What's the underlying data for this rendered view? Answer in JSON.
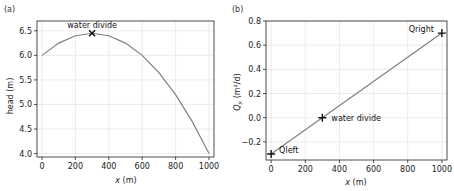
{
  "chart_data": [
    {
      "panel_label": "(a)",
      "type": "line",
      "xlabel_var": "x",
      "xlabel_unit": " (m)",
      "ylabel": "head (m)",
      "xlim": [
        -30,
        1030
      ],
      "ylim": [
        3.93,
        6.7
      ],
      "xticks": [
        0,
        200,
        400,
        600,
        800,
        1000
      ],
      "yticks": [
        4.0,
        4.5,
        5.0,
        5.5,
        6.0,
        6.5
      ],
      "ytick_labels": [
        "4.0",
        "4.5",
        "5.0",
        "5.5",
        "6.0",
        "6.5"
      ],
      "grid": true,
      "series": [
        {
          "name": "head",
          "x": [
            0,
            100,
            200,
            300,
            400,
            500,
            600,
            700,
            800,
            900,
            1000
          ],
          "y": [
            6.0,
            6.25,
            6.4,
            6.45,
            6.4,
            6.25,
            6.0,
            5.65,
            5.2,
            4.65,
            4.0
          ],
          "color": "#808080"
        }
      ],
      "markers": [
        {
          "label": "water divide",
          "x": 300,
          "y": 6.45,
          "symbol": "x"
        }
      ]
    },
    {
      "panel_label": "(b)",
      "type": "line",
      "xlabel_var": "x",
      "xlabel_unit": " (m)",
      "ylabel_var": "Q",
      "ylabel_sub": "x",
      "ylabel_unit": " (m²/d)",
      "xlim": [
        -30,
        1030
      ],
      "ylim": [
        -0.35,
        0.8
      ],
      "xticks": [
        0,
        200,
        400,
        600,
        800,
        1000
      ],
      "yticks": [
        -0.2,
        0.0,
        0.2,
        0.4,
        0.6,
        0.8
      ],
      "ytick_labels": [
        "−0.2",
        "0.0",
        "0.2",
        "0.4",
        "0.6",
        "0.8"
      ],
      "grid": true,
      "series": [
        {
          "name": "Qx",
          "x": [
            0,
            1000
          ],
          "y": [
            -0.3,
            0.7
          ],
          "color": "#808080"
        }
      ],
      "markers": [
        {
          "label": "Qleft",
          "x": 0,
          "y": -0.3,
          "symbol": "+"
        },
        {
          "label": "water divide",
          "x": 300,
          "y": 0.0,
          "symbol": "+"
        },
        {
          "label": "Qright",
          "x": 1000,
          "y": 0.7,
          "symbol": "+"
        }
      ]
    }
  ]
}
